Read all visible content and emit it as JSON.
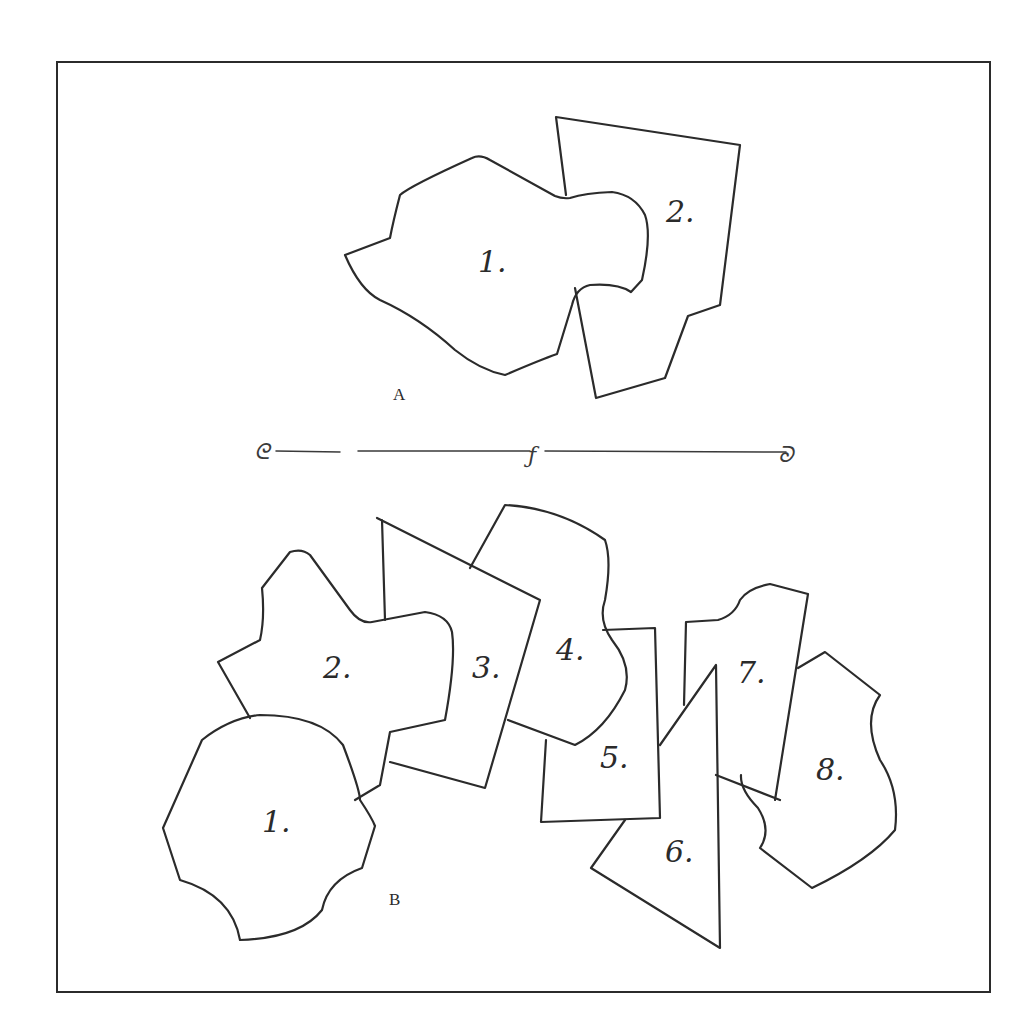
{
  "figure": {
    "colors": {
      "ink": "#2b2b2b",
      "paper": "#ffffff"
    },
    "section_a": {
      "caption": "A",
      "pieces": [
        {
          "label": "1."
        },
        {
          "label": "2."
        }
      ]
    },
    "divider": {
      "left_ornament": "ᘓ",
      "mid_ornament": "ƒ",
      "right_ornament": "ᘐ"
    },
    "section_b": {
      "caption": "B",
      "pieces": [
        {
          "label": "1."
        },
        {
          "label": "2."
        },
        {
          "label": "3."
        },
        {
          "label": "4."
        },
        {
          "label": "5."
        },
        {
          "label": "6."
        },
        {
          "label": "7."
        },
        {
          "label": "8."
        }
      ]
    }
  }
}
